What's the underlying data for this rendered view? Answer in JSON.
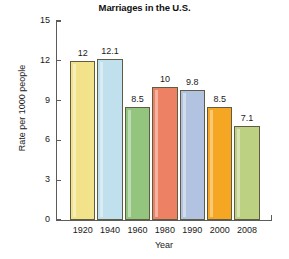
{
  "chart_data": {
    "type": "bar",
    "title": "Marriages in the U.S.",
    "xlabel": "Year",
    "ylabel": "Rate per 1000 people",
    "categories": [
      "1920",
      "1940",
      "1960",
      "1980",
      "1990",
      "2000",
      "2008"
    ],
    "values": [
      12,
      12.1,
      8.5,
      10,
      9.8,
      8.5,
      7.1
    ],
    "value_labels": [
      "12",
      "12.1",
      "8.5",
      "10",
      "9.8",
      "8.5",
      "7.1"
    ],
    "ylim": [
      0,
      15
    ],
    "yticks": [
      0,
      3,
      6,
      9,
      12,
      15
    ],
    "ytick_labels": [
      "0",
      "3",
      "6",
      "9",
      "12",
      "15"
    ],
    "grid": false,
    "legend": "none",
    "bar_colors": [
      "#f2e28a",
      "#bfe0ec",
      "#93c57f",
      "#ec8164",
      "#b1c3e0",
      "#f5a623",
      "#bdd183"
    ],
    "bar_border_color": "#5f5c44",
    "axis_color": "#5c5c5c",
    "background": "#ffffff"
  }
}
